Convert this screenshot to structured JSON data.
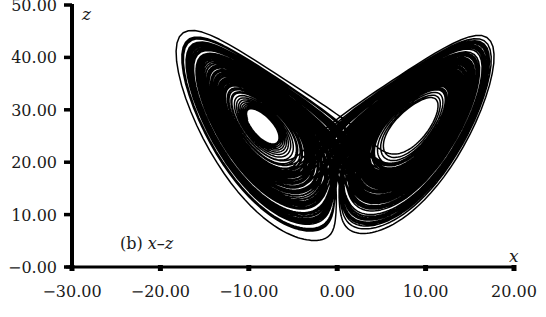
{
  "chart_data": {
    "type": "line",
    "title": "",
    "panel_label": "(b) x–z",
    "panel_label_prefix": "(b) ",
    "panel_label_vars": "x–z",
    "xlabel": "x",
    "ylabel": "z",
    "xlim": [
      -30,
      20
    ],
    "ylim": [
      0,
      50
    ],
    "xticks": [
      -30,
      -20,
      -10,
      0,
      10,
      20
    ],
    "xtick_labels": [
      "−30.00",
      "−20.00",
      "−10.00",
      "0.00",
      "10.00",
      "20.00"
    ],
    "yticks": [
      0,
      10,
      20,
      30,
      40,
      50
    ],
    "ytick_labels": [
      "−0.00",
      "10.00",
      "20.00",
      "30.00",
      "40.00",
      "50.00"
    ],
    "grid": false,
    "legend": null,
    "system": {
      "name": "Lorenz",
      "sigma": 10,
      "rho": 28,
      "beta": 2.6667,
      "initial": [
        1,
        1,
        1
      ],
      "dt": 0.004,
      "steps": 40000,
      "transient": 1000
    },
    "features": {
      "left_lobe_center": [
        -8.5,
        27
      ],
      "right_lobe_center": [
        8.5,
        27
      ],
      "x_range_observed": [
        -19,
        19
      ],
      "z_range_observed": [
        5,
        46
      ],
      "cusp_bottom": [
        0,
        5
      ]
    },
    "line_color": "#000000"
  }
}
